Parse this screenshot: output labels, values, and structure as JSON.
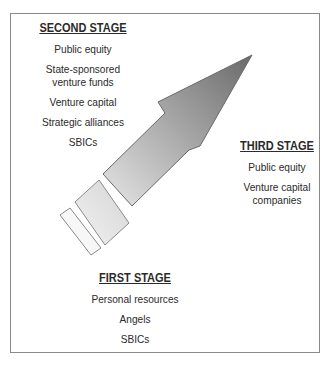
{
  "diagram": {
    "type": "financing-stages-arrow",
    "stages": [
      {
        "id": "second",
        "title": "SECOND STAGE",
        "items": [
          "Public equity",
          "State-sponsored venture funds",
          "Venture capital",
          "Strategic alliances",
          "SBICs"
        ]
      },
      {
        "id": "third",
        "title": "THIRD STAGE",
        "items": [
          "Public equity",
          "Venture capital companies"
        ]
      },
      {
        "id": "first",
        "title": "FIRST STAGE",
        "items": [
          "Personal resources",
          "Angels",
          "SBICs"
        ]
      }
    ],
    "colors": {
      "border": "#8a8a8a",
      "arrow_dark": "#6f6f6f",
      "arrow_light": "#e4e4e4",
      "segment_light": "#f4f4f4",
      "text": "#2a2a2a"
    }
  }
}
